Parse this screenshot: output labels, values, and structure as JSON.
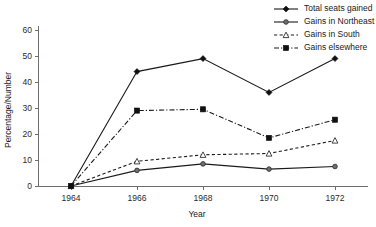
{
  "chart_data": {
    "type": "line",
    "title": "",
    "xlabel": "Year",
    "ylabel": "Percentage/Number",
    "x": [
      1964,
      1966,
      1968,
      1970,
      1972
    ],
    "categories": [
      "1964",
      "1966",
      "1968",
      "1970",
      "1972"
    ],
    "xlim": [
      1963,
      1973
    ],
    "ylim": [
      0,
      60
    ],
    "yticks": [
      0,
      10,
      20,
      30,
      40,
      50,
      60
    ],
    "ytick_labels": [
      "0",
      "10",
      "20",
      "30",
      "40",
      "50",
      "60"
    ],
    "xtick_labels": [
      "1964",
      "1966",
      "1968",
      "1970",
      "1972"
    ],
    "grid": false,
    "legend_position": "top-right",
    "series": [
      {
        "name": "Total seats gained",
        "values": [
          0,
          44,
          49,
          36,
          49
        ],
        "line_style": "solid",
        "marker": "filled-diamond"
      },
      {
        "name": "Gains in Northeast",
        "values": [
          0,
          6,
          8.5,
          6.5,
          7.5
        ],
        "line_style": "solid",
        "marker": "filled-circle"
      },
      {
        "name": "Gains in South",
        "values": [
          0,
          9.5,
          12,
          12.5,
          17.5
        ],
        "line_style": "dashed",
        "marker": "open-triangle"
      },
      {
        "name": "Gains elsewhere",
        "values": [
          0,
          29,
          29.5,
          18.5,
          25.5
        ],
        "line_style": "dash-dot",
        "marker": "filled-square"
      }
    ]
  },
  "colors": {
    "axis": "#6e6e6e",
    "ink": "#1a1a1a",
    "background": "#ffffff"
  }
}
